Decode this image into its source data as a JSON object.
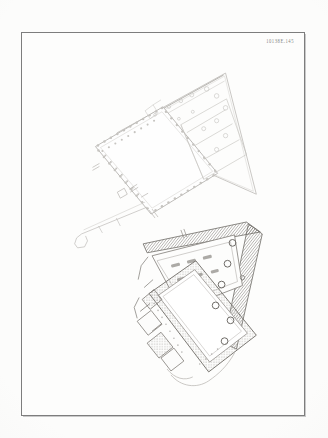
{
  "page": {
    "type": "scanned-archaeological-plate",
    "background_color": "#fcfcfb",
    "frame_color": "#7d7d7d"
  },
  "plate": {
    "catalog_label": "10138E.145",
    "figures": [
      {
        "id": "upper-plan",
        "name": "upper-site-plan",
        "description": "Light-line ground plan of a peristyle courtyard building with dotted colonnade rows, set within a wedge-shaped enclosure; a narrow hooked corridor projects to the lower left.",
        "line_tone": "#b9b7b4",
        "features": [
          "wedge-enclosure",
          "colonnade-dotted-rows",
          "rotated-rectangular-courtyard",
          "scattered-circular-column-bases",
          "hooked-corridor-projection",
          "subdivided-rooms-right"
        ]
      },
      {
        "id": "lower-plan",
        "name": "lower-site-plan",
        "description": "Darker, heavily hatched ground plan of a walled compound with a large rotated courtyard, an upper hall, and a row of circular column bases or wells along the right diagonal edge.",
        "line_tone": "#8a8782",
        "features": [
          "hatched-perimeter-wall",
          "rotated-rectangular-courtyard",
          "upper-hall-with-piers",
          "circular-bases-right-edge",
          "rubble-stippled-walls",
          "lower-left-annex"
        ]
      }
    ]
  }
}
